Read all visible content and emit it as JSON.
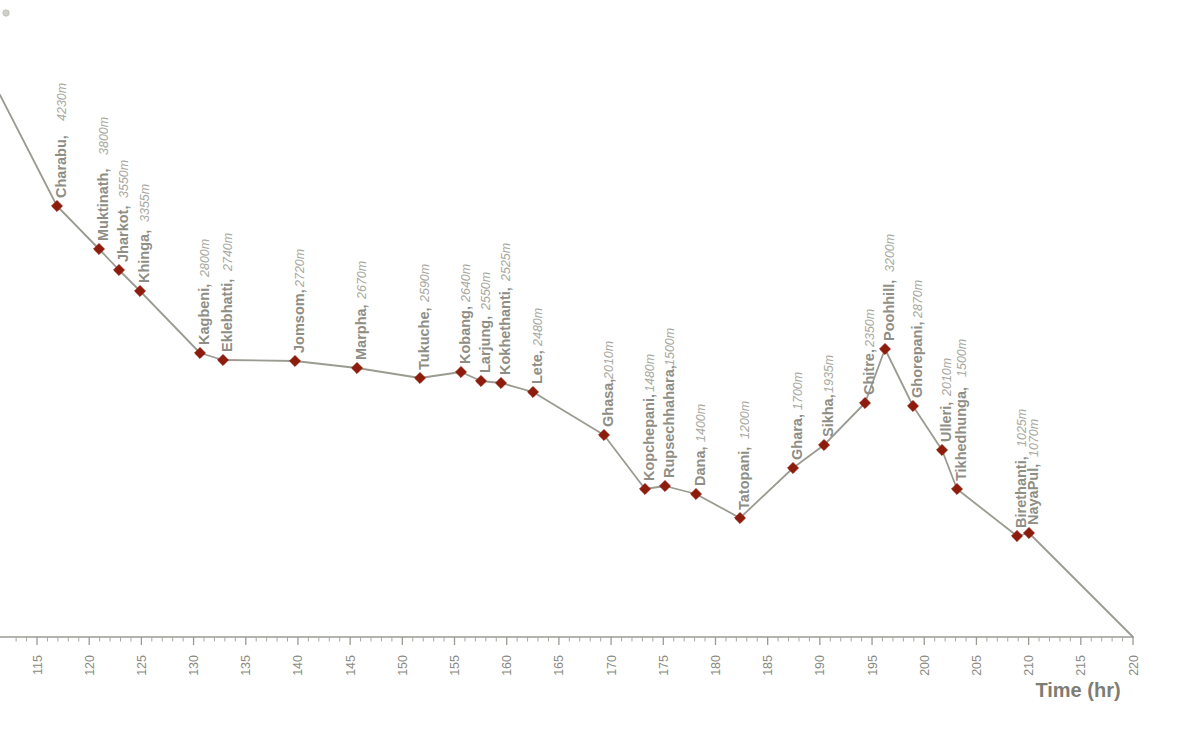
{
  "chart_data": {
    "type": "line",
    "title": "",
    "subtitle": "",
    "xlabel": "Time (hr)",
    "ylabel": "",
    "xlim": [
      113.5,
      220
    ],
    "ylim": [
      900,
      4600
    ],
    "grid": false,
    "legend": "none",
    "series_name": "Annapurna Circuit elevation profile",
    "line_color": "#9b9b91",
    "marker_color": "#8d1c0d",
    "label_name_color": "#8e8e86",
    "label_elev_color": "#a8a8a0",
    "axis_color": "#9b9b93",
    "x_ticks_major": [
      115,
      120,
      125,
      130,
      135,
      140,
      145,
      150,
      155,
      160,
      165,
      170,
      175,
      180,
      185,
      190,
      195,
      200,
      205,
      210,
      215,
      220
    ],
    "x_tick_minor_step": 1,
    "x": [
      117,
      121,
      123,
      125,
      131,
      133,
      140,
      146,
      152,
      156,
      158,
      160,
      163,
      170,
      174,
      176,
      179,
      182,
      187,
      190,
      194,
      196,
      199,
      202,
      206,
      212,
      213,
      220
    ],
    "values": [
      4230,
      3800,
      3550,
      3355,
      2800,
      2740,
      2720,
      2670,
      2590,
      2640,
      2550,
      2525,
      2480,
      2010,
      1480,
      1500,
      1400,
      1200,
      1700,
      1935,
      2350,
      3200,
      2870,
      2010,
      1500,
      1025,
      1070,
      900
    ],
    "points": [
      {
        "name": "Charabu",
        "elevation": "4230m",
        "label": "Charabu, 4230m"
      },
      {
        "name": "Muktinath",
        "elevation": "3800m",
        "label": "Muktinath, 3800m"
      },
      {
        "name": "Jharkot",
        "elevation": "3550m",
        "label": "Jharkot, 3550m"
      },
      {
        "name": "Khinga",
        "elevation": "3355m",
        "label": "Khinga, 3355m"
      },
      {
        "name": "Kagbeni",
        "elevation": "2800m",
        "label": "Kagbeni, 2800m"
      },
      {
        "name": "Eklebhatti",
        "elevation": "2740m",
        "label": "Eklebhatti, 2740m"
      },
      {
        "name": "Jomsom",
        "elevation": "2720m",
        "label": "Jomsom, 2720m"
      },
      {
        "name": "Marpha",
        "elevation": "2670m",
        "label": "Marpha, 2670m"
      },
      {
        "name": "Tukuche",
        "elevation": "2590m",
        "label": "Tukuche, 2590m"
      },
      {
        "name": "Kobang",
        "elevation": "2640m",
        "label": "Kobang, 2640m"
      },
      {
        "name": "Larjung",
        "elevation": "2550m",
        "label": "Larjung, 2550m"
      },
      {
        "name": "Kokhethanti",
        "elevation": "2525m",
        "label": "Kokhethanti, 2525m"
      },
      {
        "name": "Lete",
        "elevation": "2480m",
        "label": "Lete, 2480m"
      },
      {
        "name": "Ghasa",
        "elevation": "2010m",
        "label": "Ghasa, 2010m"
      },
      {
        "name": "Kopchepani",
        "elevation": "1480m",
        "label": "Kopchepani, 1480m"
      },
      {
        "name": "Rupsechhahara",
        "elevation": "1500m",
        "label": "Rupsechhahara, 1500m"
      },
      {
        "name": "Dana",
        "elevation": "1400m",
        "label": "Dana, 1400m"
      },
      {
        "name": "Tatopani",
        "elevation": "1200m",
        "label": "Tatopani, 1200m"
      },
      {
        "name": "Ghara",
        "elevation": "1700m",
        "label": "Ghara, 1700m"
      },
      {
        "name": "Sikha",
        "elevation": "1935m",
        "label": "Sikha, 1935m"
      },
      {
        "name": "Chitre",
        "elevation": "2350m",
        "label": "Chitre, 2350m"
      },
      {
        "name": "Poohhill",
        "elevation": "3200m",
        "label": "Poohhill, 3200m"
      },
      {
        "name": "Ghorepani",
        "elevation": "2870m",
        "label": "Ghorepani, 2870m"
      },
      {
        "name": "Ulleri",
        "elevation": "2010m",
        "label": "Ulleri, 2010m"
      },
      {
        "name": "Tikhedhunga",
        "elevation": "1500m",
        "label": "Tikhedhunga, 1500m"
      },
      {
        "name": "Birethanti",
        "elevation": "1025m",
        "label": "Birethanti, 1025m"
      },
      {
        "name": "NayaPul",
        "elevation": "1070m",
        "label": "NayaPul, 1070m"
      }
    ],
    "pixel_points": [
      {
        "px": 57,
        "py": 206
      },
      {
        "px": 99,
        "py": 249
      },
      {
        "px": 119,
        "py": 270
      },
      {
        "px": 140,
        "py": 291
      },
      {
        "px": 200,
        "py": 353
      },
      {
        "px": 223,
        "py": 360
      },
      {
        "px": 295,
        "py": 361
      },
      {
        "px": 357,
        "py": 368
      },
      {
        "px": 420,
        "py": 378
      },
      {
        "px": 461,
        "py": 372
      },
      {
        "px": 481,
        "py": 381
      },
      {
        "px": 501,
        "py": 383
      },
      {
        "px": 533,
        "py": 392
      },
      {
        "px": 604,
        "py": 435
      },
      {
        "px": 645,
        "py": 489
      },
      {
        "px": 665,
        "py": 486
      },
      {
        "px": 696,
        "py": 494
      },
      {
        "px": 740,
        "py": 518
      },
      {
        "px": 793,
        "py": 468
      },
      {
        "px": 824,
        "py": 445
      },
      {
        "px": 865,
        "py": 403
      },
      {
        "px": 885,
        "py": 349
      },
      {
        "px": 913,
        "py": 406
      },
      {
        "px": 942,
        "py": 450
      },
      {
        "px": 957,
        "py": 489
      },
      {
        "px": 1017,
        "py": 536
      },
      {
        "px": 1029,
        "py": 533
      }
    ],
    "label_anchors": [
      {
        "lx": 66,
        "ly": 198,
        "name_w": 73
      },
      {
        "lx": 108,
        "ly": 241,
        "name_w": 82
      },
      {
        "lx": 128,
        "ly": 262,
        "name_w": 60
      },
      {
        "lx": 149,
        "ly": 283,
        "name_w": 57
      },
      {
        "lx": 209,
        "ly": 345,
        "name_w": 64
      },
      {
        "lx": 232,
        "ly": 352,
        "name_w": 77
      },
      {
        "lx": 304,
        "ly": 353,
        "name_w": 62
      },
      {
        "lx": 366,
        "ly": 360,
        "name_w": 57
      },
      {
        "lx": 429,
        "ly": 370,
        "name_w": 64
      },
      {
        "lx": 470,
        "ly": 364,
        "name_w": 58
      },
      {
        "lx": 490,
        "ly": 373,
        "name_w": 59
      },
      {
        "lx": 510,
        "ly": 375,
        "name_w": 90
      },
      {
        "lx": 542,
        "ly": 384,
        "name_w": 34
      },
      {
        "lx": 613,
        "ly": 427,
        "name_w": 44
      },
      {
        "lx": 654,
        "ly": 481,
        "name_w": 85
      },
      {
        "lx": 674,
        "ly": 478,
        "name_w": 108
      },
      {
        "lx": 705,
        "ly": 486,
        "name_w": 40
      },
      {
        "lx": 749,
        "ly": 510,
        "name_w": 67
      },
      {
        "lx": 802,
        "ly": 460,
        "name_w": 46
      },
      {
        "lx": 833,
        "ly": 437,
        "name_w": 40
      },
      {
        "lx": 874,
        "ly": 395,
        "name_w": 44
      },
      {
        "lx": 894,
        "ly": 341,
        "name_w": 65
      },
      {
        "lx": 922,
        "ly": 398,
        "name_w": 76
      },
      {
        "lx": 951,
        "ly": 442,
        "name_w": 42
      },
      {
        "lx": 966,
        "ly": 481,
        "name_w": 100
      },
      {
        "lx": 1026,
        "ly": 528,
        "name_w": 77
      },
      {
        "lx": 1038,
        "ly": 525,
        "name_w": 64
      }
    ],
    "end_segment": {
      "px": 1133,
      "py": 637,
      "note": "line descends to x-axis at 220"
    },
    "start_segment": {
      "px": 0,
      "py": 95,
      "note": "line enters clipped at left edge"
    }
  },
  "axis": {
    "x_axis_title": "Time (hr)",
    "tick_labels": [
      "115",
      "120",
      "125",
      "130",
      "135",
      "140",
      "145",
      "150",
      "155",
      "160",
      "165",
      "170",
      "175",
      "180",
      "185",
      "190",
      "195",
      "200",
      "205",
      "210",
      "215",
      "220"
    ]
  },
  "colors": {
    "marker": "#8d1c0d",
    "line": "#9b9b91",
    "axis": "#9b9b93",
    "label_name": "#8e8e86",
    "label_elevation": "#a8a8a0",
    "background": "#ffffff"
  }
}
